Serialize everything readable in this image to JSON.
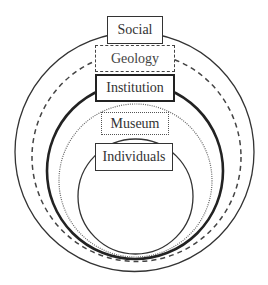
{
  "diagram": {
    "layers": [
      {
        "label": "Social",
        "line_style": "solid-thin"
      },
      {
        "label": "Geology",
        "line_style": "dashed"
      },
      {
        "label": "Institution",
        "line_style": "solid-thick"
      },
      {
        "label": "Museum",
        "line_style": "dotted"
      },
      {
        "label": "Individuals",
        "line_style": "solid-thin"
      }
    ]
  },
  "colors": {
    "line": "#333333",
    "background": "#ffffff"
  }
}
